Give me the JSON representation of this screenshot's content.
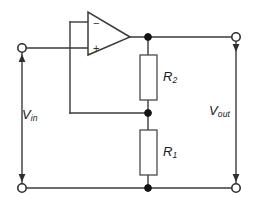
{
  "diagram": {
    "background_color": "#ffffff",
    "line_color": "#3a3a3a",
    "node_color": "#141414"
  },
  "labels": {
    "vin": {
      "symbol": "V",
      "subscript": "in"
    },
    "vout": {
      "symbol": "V",
      "subscript": "out"
    },
    "r2": {
      "symbol": "R",
      "subscript": "2"
    },
    "r1": {
      "symbol": "R",
      "subscript": "1"
    }
  },
  "opamp": {
    "name": "operational-amplifier",
    "inverting_input_sign": "−",
    "noninverting_input_sign": "+"
  },
  "components": [
    {
      "name": "resistor-r2",
      "type": "resistor",
      "label_symbol": "R",
      "label_subscript": "2"
    },
    {
      "name": "resistor-r1",
      "type": "resistor",
      "label_symbol": "R",
      "label_subscript": "1"
    }
  ],
  "terminals": [
    {
      "name": "input-positive-terminal",
      "position": "top-left"
    },
    {
      "name": "input-negative-terminal",
      "position": "bottom-left"
    },
    {
      "name": "output-positive-terminal",
      "position": "top-right"
    },
    {
      "name": "output-negative-terminal",
      "position": "bottom-right"
    }
  ],
  "nodes": [
    {
      "name": "opamp-output-node"
    },
    {
      "name": "feedback-divider-node"
    },
    {
      "name": "ground-rail-node"
    }
  ]
}
